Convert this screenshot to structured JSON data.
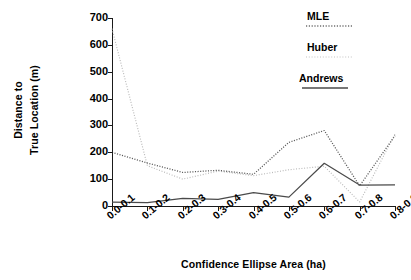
{
  "chart_data": {
    "type": "line",
    "title": "",
    "xlabel": "Confidence Ellipse Area (ha)",
    "ylabel_line1": "Distance to",
    "ylabel_line2": "True Location (m)",
    "categories": [
      "0.0-0.1",
      "0.1-0.2",
      "0.2-0.3",
      "0.3-0.4",
      "0.4-0.5",
      "0.5-0.6",
      "0.6-0.7",
      "0.7-0.8",
      "0.8-0.9"
    ],
    "ylim": [
      0,
      700
    ],
    "yticks": [
      0,
      100,
      200,
      300,
      400,
      500,
      600,
      700
    ],
    "ytick_labels": [
      "0",
      "100",
      "200",
      "300",
      "400",
      "500",
      "600",
      "700"
    ],
    "grid": false,
    "legend_position": "top-right",
    "series": [
      {
        "name": "MLE",
        "style": "dotted",
        "values": [
          200,
          160,
          125,
          133,
          118,
          237,
          281,
          75,
          262
        ]
      },
      {
        "name": "Huber",
        "style": "dotted-light",
        "values": [
          660,
          150,
          100,
          130,
          113,
          135,
          148,
          15,
          268
        ]
      },
      {
        "name": "Andrews",
        "style": "solid",
        "values": [
          14,
          13,
          28,
          25,
          50,
          33,
          159,
          78,
          79
        ]
      }
    ]
  },
  "legend": {
    "entries": [
      {
        "label": "MLE",
        "sample": "dotted-line-sample"
      },
      {
        "label": "Huber",
        "sample": "dotted-light-line-sample"
      },
      {
        "label": "Andrews",
        "sample": "solid-line-sample"
      }
    ]
  },
  "colors": {
    "axis": "#1a1a1a",
    "mle": "#5a5a5a",
    "huber": "#b9b9b9",
    "andrews": "#4a4a4a",
    "background": "#ffffff"
  }
}
